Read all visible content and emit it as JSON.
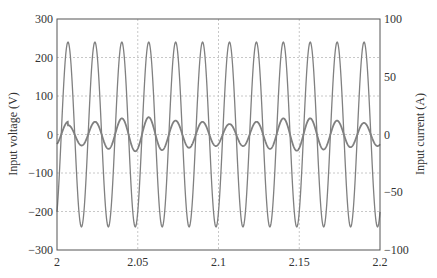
{
  "chart_data": {
    "type": "line",
    "title": "",
    "xlabel": "",
    "ylabel": "Input voltage (V)",
    "ylabel_right": "Input current (A)",
    "xlim": [
      2,
      2.2
    ],
    "ylim": [
      -300,
      300
    ],
    "ylim_right": [
      -100,
      100
    ],
    "x_ticks": [
      "2",
      "2.05",
      "2.1",
      "2.15",
      "2.2"
    ],
    "y_ticks": [
      "300",
      "200",
      "100",
      "0",
      "-100",
      "-200",
      "-300"
    ],
    "y_ticks_right": [
      "100",
      "50",
      "0",
      "-50",
      "-100"
    ],
    "grid": true,
    "legend": null,
    "series": [
      {
        "name": "Input voltage",
        "axis": "left",
        "waveform": "sine",
        "amplitude": 240,
        "frequency_hz": 60,
        "first_peak_time": 2.0068,
        "peaks": [
          240,
          240,
          240,
          240,
          240,
          240,
          240,
          240,
          240,
          240,
          240,
          240
        ]
      },
      {
        "name": "Input current",
        "axis": "right",
        "waveform": "sine",
        "frequency_hz": 60,
        "first_peak_time": 2.0068,
        "peak_amplitudes": [
          8,
          11,
          14,
          15,
          12,
          11,
          9,
          11,
          14,
          14,
          12,
          10
        ]
      }
    ],
    "colors": {
      "line": "#808080",
      "grid": "#c8c8c8",
      "axis": "#555555",
      "text": "#333333"
    }
  }
}
